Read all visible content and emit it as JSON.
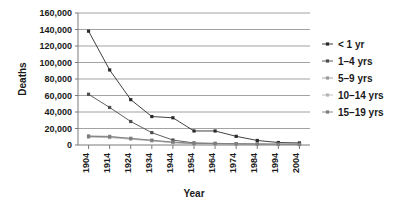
{
  "chart_data": {
    "type": "line",
    "title": "",
    "xlabel": "Year",
    "ylabel": "Deaths",
    "grid": true,
    "legend_position": "right",
    "x": [
      1904,
      1914,
      1924,
      1934,
      1944,
      1954,
      1964,
      1974,
      1984,
      1994,
      2004
    ],
    "xtick_labels": [
      "1904",
      "1914",
      "1924",
      "1934",
      "1944",
      "1954",
      "1964",
      "1974",
      "1984",
      "1994",
      "2004"
    ],
    "ytick_labels": [
      "0",
      "20,000",
      "40,000",
      "60,000",
      "80,000",
      "100,000",
      "120,000",
      "140,000",
      "160,000"
    ],
    "ytick_values": [
      0,
      20000,
      40000,
      60000,
      80000,
      100000,
      120000,
      140000,
      160000
    ],
    "ylim": [
      0,
      160000
    ],
    "series": [
      {
        "name": "< 1 yr",
        "color": "#2b2b2b",
        "marker": "square",
        "values": [
          138000,
          91000,
          55000,
          34500,
          33000,
          17000,
          17000,
          10500,
          5500,
          3000,
          2500
        ]
      },
      {
        "name": "1–4 yrs",
        "color": "#4d4d4d",
        "marker": "square",
        "values": [
          61500,
          45500,
          28500,
          15000,
          6000,
          2500,
          2000,
          1500,
          1200,
          1000,
          900
        ]
      },
      {
        "name": "5–9 yrs",
        "color": "#9a9a9a",
        "marker": "square",
        "values": [
          11000,
          10500,
          8000,
          5500,
          3000,
          1600,
          1300,
          900,
          700,
          600,
          500
        ]
      },
      {
        "name": "10–14 yrs",
        "color": "#b5b5b5",
        "marker": "square",
        "values": [
          9500,
          9000,
          7000,
          5000,
          2800,
          1500,
          1200,
          900,
          700,
          600,
          500
        ]
      },
      {
        "name": "15–19 yrs",
        "color": "#7d7d7d",
        "marker": "square",
        "values": [
          10500,
          10000,
          8000,
          5800,
          3600,
          2000,
          1700,
          1300,
          1000,
          900,
          800
        ]
      }
    ]
  },
  "legend": {
    "items": [
      "< 1 yr",
      "1–4 yrs",
      "5–9 yrs",
      "10–14 yrs",
      "15–19 yrs"
    ]
  }
}
